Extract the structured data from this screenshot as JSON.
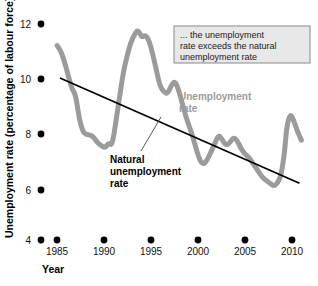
{
  "chart_data": {
    "type": "line",
    "title": "",
    "xlabel": "Year",
    "ylabel": "Unemployment rate (percentage of labour force)",
    "xlim": [
      1983.0,
      2011.0
    ],
    "ylim": [
      4,
      12
    ],
    "xticks": [
      "1985",
      "1990",
      "1995",
      "2000",
      "2005",
      "2010"
    ],
    "xtick_values": [
      1985,
      1990,
      1995,
      2000,
      2005,
      2010
    ],
    "yticks": [
      "12",
      "10",
      "8",
      "6",
      "4"
    ],
    "ytick_values": [
      12,
      10,
      8,
      6,
      4
    ],
    "grid": "off",
    "legend_position": "inline-annotations",
    "tick_marker_style": "dot",
    "series": [
      {
        "name": "Unemployment rate",
        "color": "#9b9b9b",
        "style": "thick-wavy-line",
        "x": [
          1984.0,
          1984.4,
          1984.8,
          1985.2,
          1985.6,
          1986.0,
          1986.4,
          1986.8,
          1987.2,
          1987.6,
          1988.0,
          1988.4,
          1988.8,
          1989.2,
          1989.6,
          1990.0,
          1990.4,
          1990.8,
          1991.2,
          1991.6,
          1992.0,
          1992.4,
          1992.8,
          1993.2,
          1993.6,
          1994.0,
          1994.4,
          1994.8,
          1995.2,
          1995.6,
          1996.0,
          1996.4,
          1996.8,
          1997.2,
          1997.6,
          1998.0,
          1998.4,
          1998.8,
          1999.2,
          1999.6,
          2000.0,
          2000.4,
          2000.8,
          2001.2,
          2001.6,
          2002.0,
          2002.4,
          2002.8,
          2003.2,
          2003.6,
          2004.0,
          2004.4,
          2004.8,
          2005.2,
          2005.6,
          2006.0,
          2006.4,
          2006.8,
          2007.2,
          2007.6,
          2008.0,
          2008.4,
          2008.8,
          2009.0,
          2009.4,
          2009.8,
          2010.2,
          2010.6
        ],
        "y": [
          11.2,
          11.0,
          10.6,
          10.1,
          9.6,
          9.4,
          8.5,
          8.0,
          7.9,
          7.9,
          7.8,
          7.6,
          7.5,
          7.4,
          7.6,
          7.5,
          8.4,
          9.3,
          10.2,
          10.8,
          11.3,
          11.6,
          11.8,
          11.5,
          11.6,
          11.4,
          10.9,
          10.3,
          9.7,
          9.5,
          9.4,
          9.7,
          9.9,
          9.6,
          9.1,
          8.6,
          8.2,
          7.8,
          7.3,
          6.9,
          6.8,
          7.0,
          7.3,
          7.6,
          7.9,
          7.7,
          7.5,
          7.6,
          7.8,
          7.7,
          7.4,
          7.2,
          7.1,
          6.9,
          6.7,
          6.5,
          6.3,
          6.2,
          6.1,
          6.0,
          6.1,
          6.4,
          7.3,
          8.2,
          8.7,
          8.4,
          8.0,
          7.7
        ]
      },
      {
        "name": "Natural unemployment rate",
        "color": "#000000",
        "style": "straight-line",
        "x": [
          1984.3,
          2010.4
        ],
        "y": [
          10.0,
          6.1
        ]
      }
    ],
    "annotations": [
      {
        "id": "callout-box",
        "text_lines": [
          "... the unemployment",
          "rate exceeds the natural",
          "unemployment rate"
        ],
        "box_fill": "#e8e8e8",
        "box_border": "#8a8a8a"
      },
      {
        "id": "unemployment-rate-label",
        "text_lines": [
          "Unemployment",
          "rate"
        ],
        "color": "#9b9b9b"
      },
      {
        "id": "natural-rate-label",
        "text_lines": [
          "Natural",
          "unemployment",
          "rate"
        ],
        "color": "#000000"
      }
    ]
  }
}
